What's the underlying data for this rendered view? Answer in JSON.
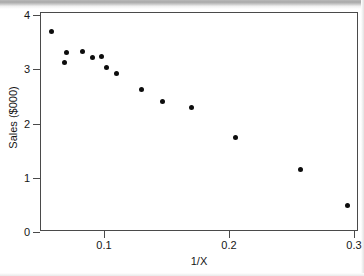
{
  "figure": {
    "background_color": "#ffffff",
    "frame_color": "#4a4a4a",
    "point_color": "#0d0d0d"
  },
  "axes": {
    "x_title": "1/X",
    "y_title": "Sales ($000)",
    "x_ticks": [
      {
        "label": "0.1",
        "value": 0.1
      },
      {
        "label": "0.2",
        "value": 0.2
      },
      {
        "label": "0.3",
        "value": 0.3
      }
    ],
    "y_ticks": [
      {
        "label": "4",
        "value": 4
      },
      {
        "label": "3",
        "value": 3
      },
      {
        "label": "2",
        "value": 2
      },
      {
        "label": "1",
        "value": 1
      },
      {
        "label": "0",
        "value": 0
      }
    ]
  },
  "chart_data": {
    "type": "scatter",
    "title": "",
    "subtitle": "",
    "xlabel": "1/X",
    "ylabel": "Sales ($000)",
    "xlim": [
      0.0484,
      0.3048
    ],
    "ylim": [
      -0.04,
      4.02
    ],
    "grid": false,
    "legend": null,
    "legend_position": "none",
    "marker": "filled-circle",
    "marker_color": "#0d0d0d",
    "marker_size": 5,
    "x_tick_labels": [
      "0.1",
      "0.2",
      "0.3"
    ],
    "y_tick_labels": [
      "0",
      "1",
      "2",
      "3",
      "4"
    ],
    "x": [
      0.058,
      0.068,
      0.07,
      0.083,
      0.091,
      0.098,
      0.102,
      0.11,
      0.13,
      0.147,
      0.17,
      0.205,
      0.257,
      0.295
    ],
    "y": [
      3.7,
      3.12,
      3.31,
      3.33,
      3.21,
      3.23,
      3.03,
      2.92,
      2.62,
      2.41,
      2.3,
      1.75,
      1.16,
      0.48
    ],
    "points": [
      {
        "x": 0.058,
        "y": 3.7
      },
      {
        "x": 0.068,
        "y": 3.12
      },
      {
        "x": 0.07,
        "y": 3.31
      },
      {
        "x": 0.083,
        "y": 3.33
      },
      {
        "x": 0.091,
        "y": 3.21
      },
      {
        "x": 0.098,
        "y": 3.23
      },
      {
        "x": 0.102,
        "y": 3.03
      },
      {
        "x": 0.11,
        "y": 2.92
      },
      {
        "x": 0.13,
        "y": 2.62
      },
      {
        "x": 0.147,
        "y": 2.41
      },
      {
        "x": 0.17,
        "y": 2.3
      },
      {
        "x": 0.205,
        "y": 1.75
      },
      {
        "x": 0.257,
        "y": 1.16
      },
      {
        "x": 0.295,
        "y": 0.48
      }
    ]
  }
}
